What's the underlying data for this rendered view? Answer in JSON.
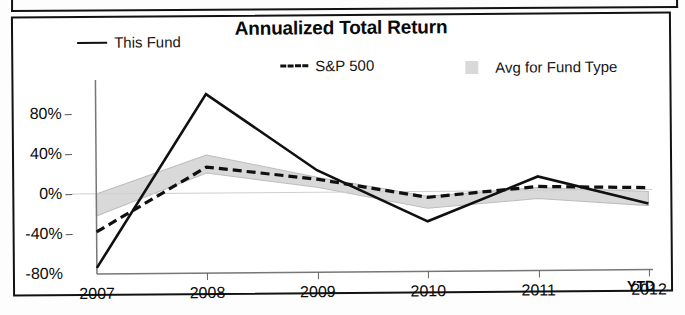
{
  "chart_data": {
    "type": "line",
    "title": "Annualized Total Return",
    "xlabel": "",
    "ylabel": "",
    "grid": false,
    "legend_position": "top",
    "categories": [
      "2007",
      "2008",
      "2009",
      "2010",
      "2011",
      "2012"
    ],
    "x_axis_note": "YTD",
    "ylim": [
      -80,
      110
    ],
    "yticks": [
      80,
      40,
      0,
      -40,
      -80
    ],
    "ytick_labels": [
      "80%",
      "40%",
      "0%",
      "-40%",
      "-80%"
    ],
    "series": [
      {
        "name": "This Fund",
        "style": "solid",
        "color": "#101010",
        "values": [
          -74,
          99,
          22,
          -30,
          14,
          -14
        ]
      },
      {
        "name": "S&P 500",
        "style": "dashed",
        "color": "#101010",
        "values": [
          -38,
          26,
          13,
          -6,
          4,
          2
        ]
      },
      {
        "name": "Avg for Fund Type",
        "style": "band",
        "color": "#d9d9d9",
        "upper": [
          0,
          38,
          15,
          -5,
          3,
          -2
        ],
        "lower": [
          -22,
          20,
          5,
          -17,
          -8,
          -16
        ]
      }
    ]
  },
  "chart": {
    "title": "Annualized Total Return",
    "legend": [
      {
        "label": "This Fund",
        "marker": "solid-line-swatch"
      },
      {
        "label": "S&P 500",
        "marker": "dashed-line-swatch"
      },
      {
        "label": "Avg for Fund Type",
        "marker": "gray-band-swatch"
      }
    ],
    "y_axis": {
      "labels": [
        "80%",
        "40%",
        "0%",
        "-40%",
        "-80%"
      ]
    },
    "x_axis": {
      "labels": [
        "2007",
        "2008",
        "2009",
        "2010",
        "2011",
        "2012"
      ],
      "suffix": "YTD"
    }
  }
}
